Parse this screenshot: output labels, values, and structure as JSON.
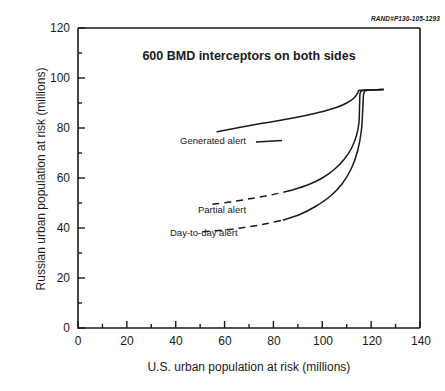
{
  "figure": {
    "rand_id": "RAND#P130-105-1293"
  },
  "chart_data": {
    "type": "line",
    "title": "600 BMD interceptors on both sides",
    "xlabel": "U.S. urban population at risk (millions)",
    "ylabel": "Russian urban population at risk (millions)",
    "xlim": [
      0,
      140
    ],
    "ylim": [
      0,
      120
    ],
    "xticks": [
      0,
      20,
      40,
      60,
      80,
      100,
      120,
      140
    ],
    "yticks": [
      0,
      20,
      40,
      60,
      80,
      100,
      120
    ],
    "x_minor_step": 10,
    "y_minor_step": 10,
    "grid": false,
    "legend": "inline-annotations",
    "series": [
      {
        "name": "Generated alert",
        "style": "solid",
        "label_x": 63,
        "label_y": 80,
        "points": [
          [
            57,
            78.5
          ],
          [
            65,
            80.0
          ],
          [
            72,
            81.3
          ],
          [
            80,
            82.6
          ],
          [
            88,
            84.0
          ],
          [
            95,
            85.4
          ],
          [
            101,
            86.8
          ],
          [
            106,
            88.3
          ],
          [
            110,
            90.0
          ],
          [
            113,
            92.0
          ],
          [
            114.5,
            94.0
          ],
          [
            115,
            95.0
          ],
          [
            118,
            95.2
          ],
          [
            122,
            95.3
          ],
          [
            125,
            95.4
          ]
        ]
      },
      {
        "name": "Partial alert",
        "style": "dashed-then-solid",
        "label_x": 61,
        "label_y": 52,
        "points": [
          [
            55,
            49.5
          ],
          [
            63,
            50.5
          ],
          [
            71,
            51.8
          ],
          [
            79,
            53.2
          ],
          [
            87,
            55.0
          ],
          [
            94,
            57.2
          ],
          [
            100,
            60.0
          ],
          [
            105,
            63.5
          ],
          [
            109,
            67.5
          ],
          [
            112,
            72.0
          ],
          [
            114,
            77.0
          ],
          [
            115,
            82.0
          ],
          [
            115.3,
            90.0
          ],
          [
            115.5,
            94.0
          ],
          [
            116.5,
            95.0
          ],
          [
            120,
            95.2
          ],
          [
            125,
            95.4
          ]
        ]
      },
      {
        "name": "Day-to-day alert",
        "style": "dashed-then-solid",
        "label_x": 57,
        "label_y": 41,
        "points": [
          [
            51,
            38.5
          ],
          [
            60,
            39.2
          ],
          [
            68,
            40.2
          ],
          [
            76,
            41.5
          ],
          [
            84,
            43.2
          ],
          [
            91,
            45.5
          ],
          [
            97,
            48.5
          ],
          [
            103,
            52.5
          ],
          [
            108,
            57.5
          ],
          [
            112,
            64.0
          ],
          [
            114.5,
            71.0
          ],
          [
            116,
            79.0
          ],
          [
            116.6,
            88.0
          ],
          [
            117,
            94.0
          ],
          [
            118.5,
            95.1
          ],
          [
            122,
            95.3
          ],
          [
            125,
            95.4
          ]
        ]
      }
    ]
  }
}
